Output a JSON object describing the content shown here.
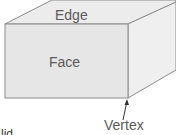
{
  "diagram": {
    "labels": {
      "edge": "Edge",
      "face": "Face",
      "vertex": "Vertex",
      "cut_off_text": "lid"
    },
    "colors": {
      "front_face": "#e6e6e6",
      "top_face": "#ececec",
      "side_face": "#efefef",
      "edge_line": "#8c8c8c",
      "label_text": "#5a5a5a"
    }
  }
}
